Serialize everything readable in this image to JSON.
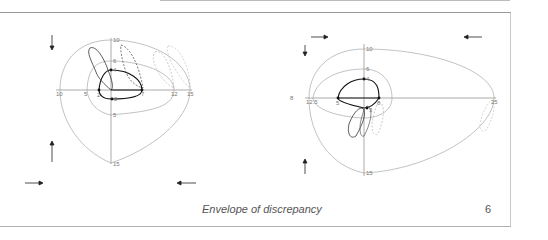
{
  "caption": "Envelope of discrepancy",
  "page_number": "6",
  "figures": [
    {
      "id": "left",
      "x_tick_labels": [
        "10",
        "5",
        "2",
        "7",
        "12",
        "15"
      ],
      "y_tick_labels": [
        "10",
        "6",
        "4",
        "2",
        "5",
        "15"
      ],
      "arrows": [
        "down",
        "up",
        "right",
        "left"
      ]
    },
    {
      "id": "right",
      "x_tick_labels": [
        "8",
        "12.5",
        "5",
        "8",
        "25"
      ],
      "y_tick_labels": [
        "10",
        "6",
        "4",
        "3",
        "15"
      ],
      "arrows": [
        "right",
        "left",
        "down",
        "up"
      ]
    }
  ]
}
